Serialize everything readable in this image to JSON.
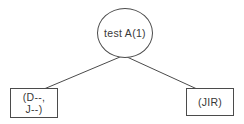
{
  "diagram": {
    "root_label": "test A(1)",
    "left_leaf": {
      "line1": "(D--,",
      "line2": "J--)"
    },
    "right_leaf": {
      "label": "(JIR)"
    }
  },
  "colors": {
    "background": "#ffffff",
    "stroke": "#4b4b4b",
    "text": "#383838"
  }
}
